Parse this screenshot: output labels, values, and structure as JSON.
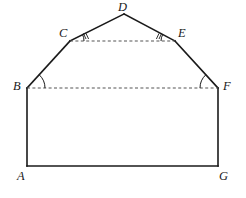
{
  "figure": {
    "kind": "geometry-diagram",
    "background_color": "#ffffff",
    "stroke_color": "#1a1a1a",
    "dash_color": "#555555",
    "solid_stroke_width": 1.6,
    "dashed_stroke_width": 1.1,
    "dash_pattern": "3,2.4",
    "vertices": [
      {
        "name": "A",
        "x": 27,
        "y": 166,
        "label": "A",
        "label_x": 17,
        "label_y": 170
      },
      {
        "name": "B",
        "x": 27,
        "y": 88,
        "label": "B",
        "label_x": 13,
        "label_y": 80
      },
      {
        "name": "C",
        "x": 70,
        "y": 41,
        "label": "C",
        "label_x": 59,
        "label_y": 27
      },
      {
        "name": "D",
        "x": 124,
        "y": 14,
        "label": "D",
        "label_x": 118,
        "label_y": 1
      },
      {
        "name": "E",
        "x": 175,
        "y": 41,
        "label": "E",
        "label_x": 178,
        "label_y": 27
      },
      {
        "name": "F",
        "x": 218,
        "y": 88,
        "label": "F",
        "label_x": 223,
        "label_y": 80
      },
      {
        "name": "G",
        "x": 218,
        "y": 166,
        "label": "G",
        "label_x": 219,
        "label_y": 170
      }
    ],
    "solid_edges": [
      {
        "name": "edge-A-B",
        "from": "A",
        "to": "B"
      },
      {
        "name": "edge-B-C",
        "from": "B",
        "to": "C"
      },
      {
        "name": "edge-C-D",
        "from": "C",
        "to": "D"
      },
      {
        "name": "edge-D-E",
        "from": "D",
        "to": "E"
      },
      {
        "name": "edge-E-F",
        "from": "E",
        "to": "F"
      },
      {
        "name": "edge-F-G",
        "from": "F",
        "to": "G"
      },
      {
        "name": "edge-G-A",
        "from": "G",
        "to": "A"
      }
    ],
    "dashed_edges": [
      {
        "name": "dashed-segment-C-E",
        "from": "C",
        "to": "E"
      },
      {
        "name": "dashed-segment-B-F",
        "from": "B",
        "to": "F"
      }
    ],
    "angle_marks": [
      {
        "name": "angle-mark-B",
        "vertex": "B",
        "arcs": 1,
        "ticks": 0
      },
      {
        "name": "angle-mark-C",
        "vertex": "C",
        "arcs": 1,
        "ticks": 2
      },
      {
        "name": "angle-mark-E",
        "vertex": "E",
        "arcs": 1,
        "ticks": 2
      },
      {
        "name": "angle-mark-F",
        "vertex": "F",
        "arcs": 1,
        "ticks": 0
      }
    ]
  }
}
